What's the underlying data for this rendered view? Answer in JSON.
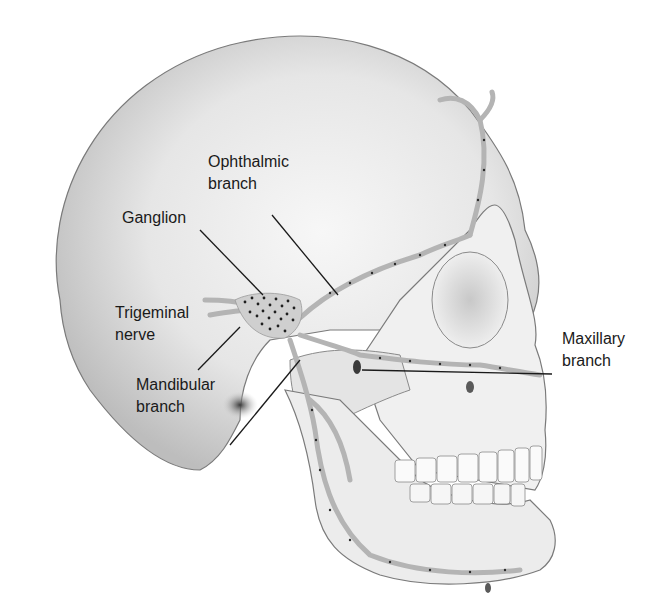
{
  "figure": {
    "colors": {
      "background": "#ffffff",
      "bone": "#efefef",
      "bone_shadow": "#9a9a9a",
      "outline": "#6e6e6e",
      "nerve": "#b8b8b8",
      "nerve_dots": "#2a2a2a",
      "leader_line": "#1a1a1a",
      "text": "#1a1a1a"
    }
  },
  "labels": {
    "ophthalmic": {
      "line1": "Ophthalmic",
      "line2": "branch"
    },
    "ganglion": {
      "line1": "Ganglion"
    },
    "trigeminal": {
      "line1": "Trigeminal",
      "line2": "nerve"
    },
    "mandibular": {
      "line1": "Mandibular",
      "line2": "branch"
    },
    "maxillary": {
      "line1": "Maxillary",
      "line2": "branch"
    }
  }
}
